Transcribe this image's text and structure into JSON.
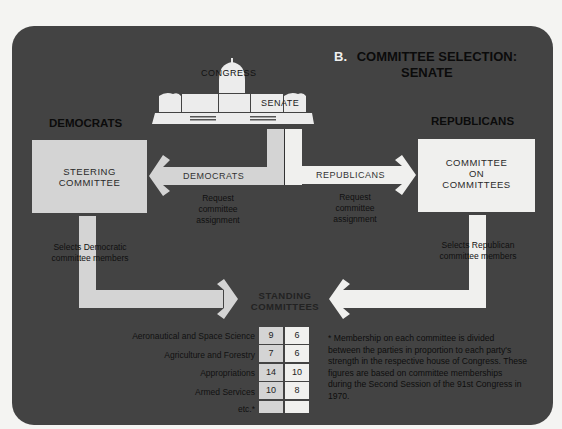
{
  "title": {
    "prefix": "B.",
    "line1": "COMMITTEE SELECTION:",
    "line2": "SENATE"
  },
  "capitol": {
    "congress_label": "CONGRESS",
    "senate_label": "SENATE"
  },
  "democrats": {
    "header": "DEMOCRATS",
    "box_line1": "STEERING",
    "box_line2": "COMMITTEE",
    "arrow_label": "DEMOCRATS",
    "request_line1": "Request",
    "request_line2": "committee",
    "request_line3": "assignment",
    "selects_line1": "Selects Democratic",
    "selects_line2": "committee members"
  },
  "republicans": {
    "header": "REPUBLICANS",
    "box_line1": "COMMITTEE",
    "box_line2": "ON",
    "box_line3": "COMMITTEES",
    "arrow_label": "REPUBLICANS",
    "request_line1": "Request",
    "request_line2": "committee",
    "request_line3": "assignment",
    "selects_line1": "Selects Republican",
    "selects_line2": "committee members"
  },
  "standing": {
    "line1": "STANDING",
    "line2": "COMMITTEES"
  },
  "table": {
    "rows": [
      {
        "name": "Aeronautical and Space Science",
        "dem": "9",
        "rep": "6"
      },
      {
        "name": "Agriculture and Forestry",
        "dem": "7",
        "rep": "6"
      },
      {
        "name": "Appropriations",
        "dem": "14",
        "rep": "10"
      },
      {
        "name": "Armed Services",
        "dem": "10",
        "rep": "8"
      },
      {
        "name": "etc.*",
        "dem": "",
        "rep": ""
      }
    ]
  },
  "footnote": "* Membership on each committee is divided between the parties in proportion to each party's strength in the respective house of Congress.  These figures are based on committee memberships during the Second Session of the 91st Congress in 1970.",
  "colors": {
    "panel": "#434343",
    "democrat_fill": "#d4d4d4",
    "republican_fill": "#f0f0ee",
    "page": "#f4f4f2"
  }
}
